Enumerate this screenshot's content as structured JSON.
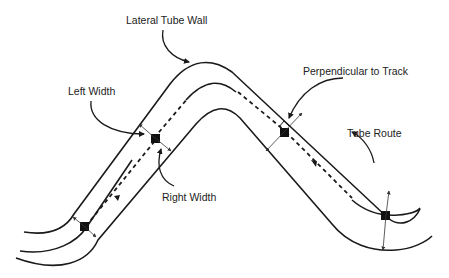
{
  "diagram": {
    "labels": {
      "lateral_tube_wall": "Lateral Tube Wall",
      "left_width": "Left Width",
      "right_width": "Right Width",
      "perpendicular_to_track": "Perpendicular to Track",
      "tube_route": "Tube Route"
    },
    "colors": {
      "stroke": "#1a1a1a",
      "background": "#ffffff"
    }
  }
}
